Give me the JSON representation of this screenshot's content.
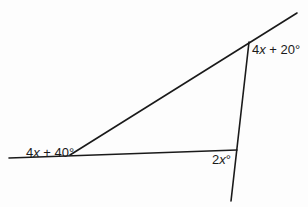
{
  "diagram": {
    "type": "geometry-triangle-exterior-angles",
    "line_color": "#1a1a1a",
    "background": "#ffffff",
    "lines": [
      {
        "name": "base-line",
        "x1": 9,
        "y1": 158,
        "x2": 237,
        "y2": 150
      },
      {
        "name": "upper-line",
        "x1": 70,
        "y1": 155,
        "x2": 297,
        "y2": 13
      },
      {
        "name": "steep-line",
        "x1": 249,
        "y1": 42,
        "x2": 231,
        "y2": 201
      }
    ],
    "vertices": [
      {
        "name": "left-vertex",
        "x": 70,
        "y": 155
      },
      {
        "name": "top-right-vertex",
        "x": 249,
        "y": 42
      },
      {
        "name": "bottom-right-vertex",
        "x": 237,
        "y": 150
      }
    ],
    "angle_labels": {
      "top": {
        "coef": "4",
        "var": "x",
        "rest": " + 20°"
      },
      "left": {
        "coef": "4",
        "var": "x",
        "rest": " + 40°"
      },
      "bottom": {
        "coef": "2",
        "var": "x",
        "rest": "°"
      }
    }
  }
}
